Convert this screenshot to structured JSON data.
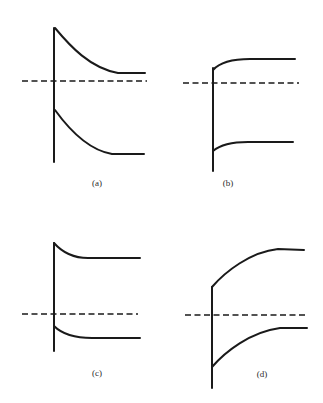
{
  "figure": {
    "stroke_color": "#1a1a1a",
    "background": "#ffffff",
    "panels": [
      {
        "id": "a",
        "label": "(a)",
        "label_pos": [
          97,
          186
        ],
        "interface": {
          "x": 54,
          "y1": 28,
          "y2": 162
        },
        "dashed_level": {
          "y": 81,
          "x1": 22,
          "x2": 147
        },
        "upper_curve": "M55,28 C70,46 90,68 118,73 L145,73",
        "lower_curve": "M55,110 C68,128 88,150 112,154 L144,154",
        "bending": "downward toward bulk (bands bent up at interface)"
      },
      {
        "id": "b",
        "label": "(b)",
        "label_pos": [
          228,
          186
        ],
        "interface": {
          "x": 213,
          "y1": 68,
          "y2": 171
        },
        "dashed_level": {
          "y": 83,
          "x1": 183,
          "x2": 299
        },
        "upper_curve": "M213,70 C220,62 235,59 250,59 L295,59",
        "lower_curve": "M213,151 C220,145 232,142 248,142 L293,142",
        "bending": "upward toward bulk (bands bent down at interface)"
      },
      {
        "id": "c",
        "label": "(c)",
        "label_pos": [
          97,
          376
        ],
        "interface": {
          "x": 54,
          "y1": 243,
          "y2": 351
        },
        "dashed_level": {
          "y": 314,
          "x1": 22,
          "x2": 138
        },
        "upper_curve": "M54,243 C62,252 72,258 88,258 L140,258",
        "lower_curve": "M54,326 C62,334 74,338 92,338 L140,338",
        "bending": "slight downward toward bulk"
      },
      {
        "id": "d",
        "label": "(d)",
        "label_pos": [
          262,
          377
        ],
        "interface": {
          "x": 212,
          "y1": 287,
          "y2": 388
        },
        "dashed_level": {
          "y": 315,
          "x1": 185,
          "x2": 306
        },
        "upper_curve": "M212,287 C225,272 250,252 278,249 L304,250",
        "lower_curve": "M212,367 C225,352 250,332 280,328 L307,328",
        "bending": "strong upward toward bulk"
      }
    ]
  }
}
